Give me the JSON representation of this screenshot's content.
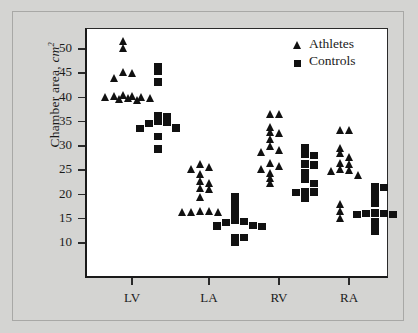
{
  "figure": {
    "background_color": "#d4d4d2",
    "panel_color": "#ffffff",
    "marker_color": "#111111"
  },
  "legend": {
    "position": "top-right",
    "entries": [
      {
        "label": "Athletes",
        "symbol": "triangle"
      },
      {
        "label": "Controls",
        "symbol": "square"
      }
    ]
  },
  "axes": {
    "ylabel_text": "Chamber area, ",
    "ylabel_unit": "cm",
    "ylabel_exponent": "2",
    "y_ticks": [
      10,
      15,
      20,
      25,
      30,
      35,
      40,
      45,
      50
    ],
    "y_tick_labels": [
      "10",
      "15",
      "20",
      "25",
      "30",
      "35",
      "40",
      "45",
      "50"
    ],
    "x_tick_labels": [
      "LV",
      "LA",
      "RV",
      "RA"
    ]
  },
  "chart_data": {
    "type": "scatter",
    "title": "",
    "xlabel": "",
    "ylabel": "Chamber area, cm2",
    "ylim": [
      5,
      53
    ],
    "grid": false,
    "legend_position": "top-right",
    "categories": [
      "LV",
      "LA",
      "RV",
      "RA"
    ],
    "series": [
      {
        "name": "Athletes",
        "symbol": "triangle",
        "color": "#111111",
        "groups": [
          {
            "category": "LV",
            "values": [
              51.6,
              50.2,
              45.2,
              45.0,
              44.1,
              40.6,
              40.4,
              40.3,
              40.2,
              40.1,
              39.9,
              39.8,
              39.6,
              39.5
            ]
          },
          {
            "category": "LA",
            "values": [
              26.2,
              25.6,
              25.2,
              24.2,
              22.7,
              22.4,
              21.4,
              21.2,
              19.4,
              16.6,
              16.5,
              16.4,
              16.4,
              16.3
            ]
          },
          {
            "category": "RV",
            "values": [
              36.6,
              36.5,
              34.0,
              32.9,
              32.7,
              31.5,
              29.9,
              29.2,
              28.7,
              26.4,
              25.9,
              25.3,
              24.4,
              23.3,
              22.4
            ]
          },
          {
            "category": "RA",
            "values": [
              33.3,
              33.2,
              29.6,
              28.6,
              27.8,
              26.5,
              26.3,
              25.2,
              25.1,
              24.9,
              24.1,
              18.1,
              16.6,
              15.1
            ]
          }
        ]
      },
      {
        "name": "Controls",
        "symbol": "square",
        "color": "#111111",
        "groups": [
          {
            "category": "LV",
            "values": [
              46.3,
              45.3,
              43.2,
              36.2,
              36.1,
              35.0,
              34.8,
              34.6,
              33.7,
              33.6,
              31.9,
              29.4
            ]
          },
          {
            "category": "LA",
            "values": [
              19.6,
              18.4,
              16.9,
              15.7,
              14.6,
              14.4,
              14.2,
              13.6,
              13.5,
              13.4,
              11.2,
              11.1,
              10.1
            ]
          },
          {
            "category": "RV",
            "values": [
              29.6,
              28.3,
              28.1,
              26.3,
              26.1,
              24.6,
              23.2,
              22.3,
              20.6,
              20.5,
              20.4,
              19.2
            ]
          },
          {
            "category": "RA",
            "values": [
              21.6,
              21.5,
              20.4,
              19.3,
              18.2,
              16.2,
              16.1,
              16.0,
              15.9,
              15.8,
              14.4,
              13.3,
              12.4
            ]
          }
        ]
      }
    ]
  }
}
